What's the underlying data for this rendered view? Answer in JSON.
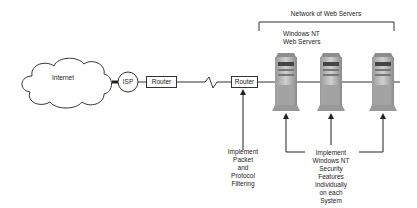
{
  "diagram": {
    "cloud": {
      "label": "Internet"
    },
    "isp": {
      "label": "ISP"
    },
    "router_isp": {
      "label": "Router"
    },
    "router_local": {
      "label": "Router"
    },
    "network_group": {
      "title": "Network of Web Servers"
    },
    "servers_label": {
      "line1": "Windows NT",
      "line2": "Web Servers"
    },
    "servers": [
      {
        "name": "Web Server 1"
      },
      {
        "name": "Web Server 2"
      },
      {
        "name": "Web Server 3"
      }
    ],
    "annotation_filtering": {
      "lines": [
        "Implement",
        "Packet",
        "and",
        "Protocol",
        "Filtering"
      ]
    },
    "annotation_security": {
      "lines": [
        "Implement",
        "Windows NT",
        "Security",
        "Features",
        "Individually",
        "on each",
        "System"
      ]
    }
  },
  "colors": {
    "line": "#333333",
    "server_body": "#b8b8b8",
    "server_dark": "#6e6e6e",
    "background": "#ffffff"
  }
}
